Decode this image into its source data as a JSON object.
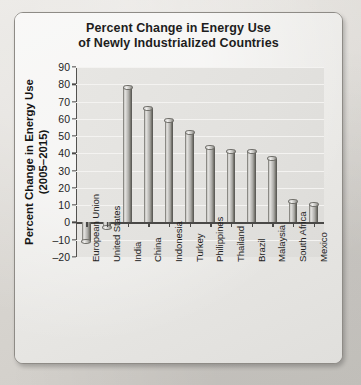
{
  "chart_data": {
    "type": "bar",
    "title": "Percent Change in Energy Use of Newly Industrialized Countries",
    "title_line1": "Percent Change in Energy Use",
    "title_line2": "of Newly Industrialized Countries",
    "xlabel": "",
    "ylabel": "Percent Change in Energy Use (2005–2015)",
    "ylabel_line1": "Percent Change in Energy Use",
    "ylabel_line2": "(2005–2015)",
    "categories": [
      "European Union",
      "United States",
      "India",
      "China",
      "Indonesia",
      "Turkey",
      "Philippines",
      "Thailand",
      "Brazil",
      "Malaysia",
      "South Africa",
      "Mexico"
    ],
    "values": [
      -11,
      -3,
      78,
      66,
      59,
      52,
      43,
      41,
      41,
      37,
      12,
      10
    ],
    "ylim": [
      -20,
      90
    ],
    "ytick_labels": [
      "90",
      "80",
      "70",
      "60",
      "50",
      "40",
      "30",
      "20",
      "10",
      "0",
      "–10",
      "–20"
    ],
    "ytick_values": [
      90,
      80,
      70,
      60,
      50,
      40,
      30,
      20,
      10,
      0,
      -10,
      -20
    ],
    "ytick_step": 10,
    "grid": true,
    "legend": false,
    "bar_style": "cylinder-3d",
    "colors": {
      "bar_light": "#e6e5e2",
      "bar_mid": "#b9b8b4",
      "bar_dark": "#77766f",
      "plot_background": "#e3e2df",
      "card_background": "#eceae7",
      "page_background": "#dedbd6",
      "axis": "#4a4947",
      "text": "#1d1d1d",
      "gridline": "#f4f3f1"
    }
  }
}
